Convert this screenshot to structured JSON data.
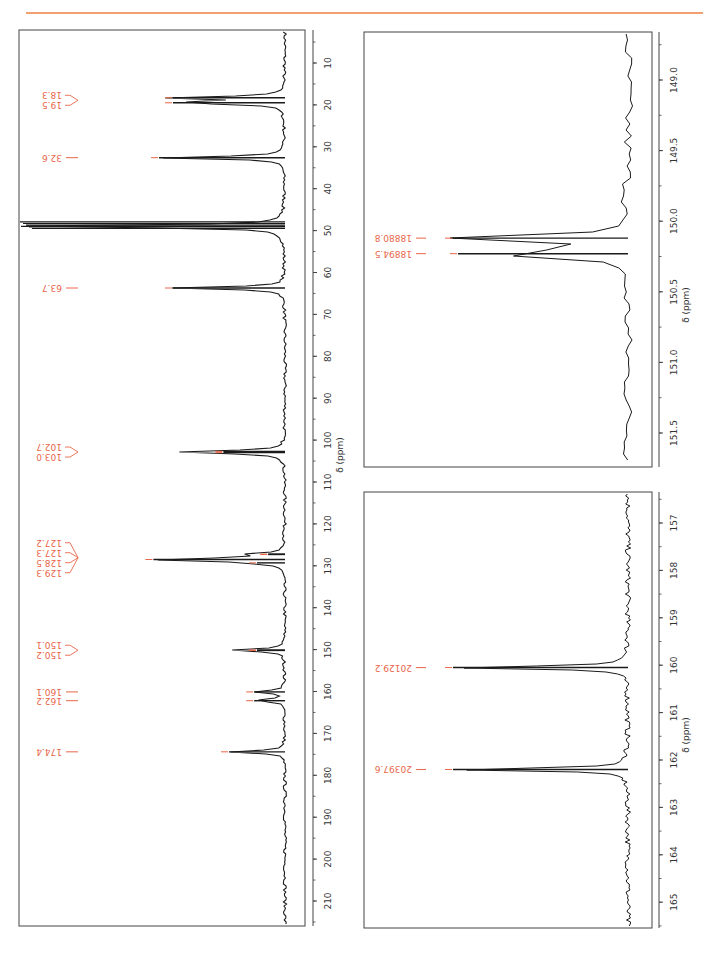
{
  "page": {
    "header_rule_color": "#f0a070",
    "label_color": "#e8664a",
    "trace_color": "#1a1a1a"
  },
  "chart_data": [
    {
      "type": "line",
      "name": "13C NMR spectrum (full)",
      "xlabel": "δ (ppm)",
      "xlim": [
        5,
        213
      ],
      "ticks": [
        "10",
        "20",
        "30",
        "40",
        "50",
        "60",
        "70",
        "80",
        "90",
        "100",
        "110",
        "120",
        "130",
        "140",
        "150",
        "160",
        "170",
        "180",
        "190",
        "200",
        "210"
      ],
      "orientation": "rotated 90° (ppm axis vertical, increasing downward)",
      "peaks": [
        {
          "label": "18.3",
          "ppm": 18.3,
          "rel_intensity": 0.4
        },
        {
          "label": "19.5",
          "ppm": 19.5,
          "rel_intensity": 0.4
        },
        {
          "label": "32.6",
          "ppm": 32.6,
          "rel_intensity": 0.45
        },
        {
          "label": "solvent",
          "ppm": 49.0,
          "rel_intensity": 1.0
        },
        {
          "label": "63.7",
          "ppm": 63.7,
          "rel_intensity": 0.4
        },
        {
          "label": "102.7",
          "ppm": 102.7,
          "rel_intensity": 0.22
        },
        {
          "label": "103.0",
          "ppm": 103.0,
          "rel_intensity": 0.22
        },
        {
          "label": "127.2",
          "ppm": 127.2,
          "rel_intensity": 0.06
        },
        {
          "label": "127.3",
          "ppm": 127.3,
          "rel_intensity": 0.06
        },
        {
          "label": "128.5",
          "ppm": 128.5,
          "rel_intensity": 0.47
        },
        {
          "label": "129.3",
          "ppm": 129.3,
          "rel_intensity": 0.1
        },
        {
          "label": "150.1",
          "ppm": 150.1,
          "rel_intensity": 0.1
        },
        {
          "label": "150.2",
          "ppm": 150.2,
          "rel_intensity": 0.1
        },
        {
          "label": "160.1",
          "ppm": 160.1,
          "rel_intensity": 0.11
        },
        {
          "label": "162.2",
          "ppm": 162.2,
          "rel_intensity": 0.11
        },
        {
          "label": "174.4",
          "ppm": 174.4,
          "rel_intensity": 0.2
        }
      ],
      "grouped_labels": [
        {
          "labels": [
            "18.3",
            "19.5"
          ],
          "connector": "bracket"
        },
        {
          "labels": [
            "32.6"
          ],
          "connector": "line"
        },
        {
          "labels": [
            "63.7"
          ],
          "connector": "line"
        },
        {
          "labels": [
            "102.7",
            "103.0"
          ],
          "connector": "bracket"
        },
        {
          "labels": [
            "127.2",
            "127.3",
            "128.5",
            "129.3"
          ],
          "connector": "bracket"
        },
        {
          "labels": [
            "150.1",
            "150.2"
          ],
          "connector": "bracket"
        },
        {
          "labels": [
            "160.1"
          ],
          "connector": "line"
        },
        {
          "labels": [
            "162.2"
          ],
          "connector": "line"
        },
        {
          "labels": [
            "174.4"
          ],
          "connector": "line"
        }
      ]
    },
    {
      "type": "line",
      "name": "Expansion 149–151.5 ppm",
      "xlabel": "δ (ppm)",
      "xlim": [
        148.75,
        151.75
      ],
      "ticks": [
        "149.0",
        "149.5",
        "150.0",
        "150.5",
        "151.0",
        "151.5"
      ],
      "peaks": [
        {
          "label": "18880.8",
          "ppm": 150.12,
          "rel_intensity": 0.7,
          "unit": "Hz"
        },
        {
          "label": "18894.5",
          "ppm": 150.23,
          "rel_intensity": 0.68,
          "unit": "Hz"
        }
      ]
    },
    {
      "type": "line",
      "name": "Expansion 156.5–165.5 ppm",
      "xlabel": "δ (ppm)",
      "xlim": [
        156.5,
        165.6
      ],
      "ticks": [
        "157",
        "158",
        "159",
        "160",
        "161",
        "162",
        "163",
        "164",
        "165"
      ],
      "peaks": [
        {
          "label": "20129.2",
          "ppm": 160.05,
          "rel_intensity": 0.7,
          "unit": "Hz"
        },
        {
          "label": "20397.6",
          "ppm": 162.2,
          "rel_intensity": 0.7,
          "unit": "Hz"
        }
      ]
    }
  ]
}
